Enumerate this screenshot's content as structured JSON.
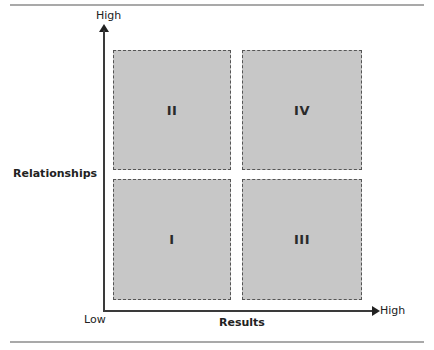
{
  "diagram": {
    "y_axis": {
      "label": "Relationships",
      "high_label": "High"
    },
    "x_axis": {
      "label": "Results",
      "low_label": "Low",
      "high_label": "High"
    },
    "quadrants": [
      {
        "id": "II",
        "position": "top-left",
        "label": "II"
      },
      {
        "id": "IV",
        "position": "top-right",
        "label": "IV"
      },
      {
        "id": "I",
        "position": "bottom-left",
        "label": "I"
      },
      {
        "id": "III",
        "position": "bottom-right",
        "label": "III"
      }
    ],
    "colors": {
      "quadrant_fill": "#c7c7c7",
      "quadrant_border": "#555555",
      "axis": "#3a3a3a",
      "rule": "#a9a9a9"
    }
  }
}
